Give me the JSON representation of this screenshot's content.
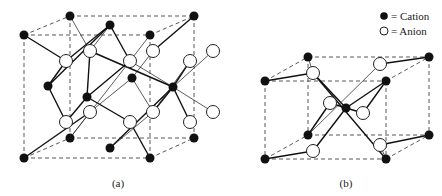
{
  "legend": {
    "cation_label": "= Cation",
    "anion_label": "= Anion"
  },
  "figures": [
    {
      "id": "a",
      "caption": "(a)"
    },
    {
      "id": "b",
      "caption": "(b)"
    }
  ],
  "colors": {
    "cation": "#111111",
    "anion_fill": "#ffffff",
    "anion_stroke": "#222222"
  }
}
